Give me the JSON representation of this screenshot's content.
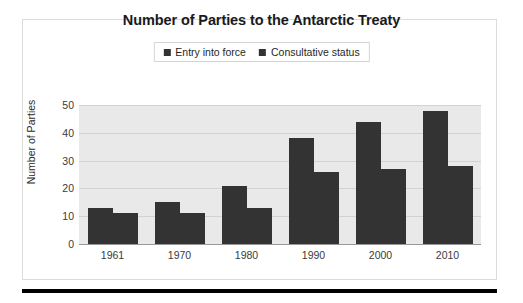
{
  "chart_data": {
    "type": "bar",
    "title": "Number of Parties to the Antarctic Treaty",
    "xlabel": "",
    "ylabel": "Number of Parties",
    "categories": [
      "1961",
      "1970",
      "1980",
      "1990",
      "2000",
      "2010"
    ],
    "series": [
      {
        "name": "Entry into force",
        "values": [
          13,
          15,
          21,
          38,
          44,
          48
        ],
        "color": "#333333"
      },
      {
        "name": "Consultative status",
        "values": [
          11,
          11,
          13,
          26,
          27,
          28
        ],
        "color": "#333333"
      }
    ],
    "ylim": [
      0,
      50
    ],
    "yticks": [
      0,
      10,
      20,
      30,
      40,
      50
    ],
    "ytick_labels": [
      "0",
      "10",
      "20",
      "30",
      "40",
      "50"
    ],
    "grid": true,
    "grid_axis": "y",
    "legend_position": "top-center",
    "plot_background": "#e9e9e9",
    "figure_background": "#ffffff",
    "bar_color": "#333333"
  },
  "legend": {
    "entries": [
      {
        "label": "Entry into force"
      },
      {
        "label": "Consultative status"
      }
    ]
  }
}
